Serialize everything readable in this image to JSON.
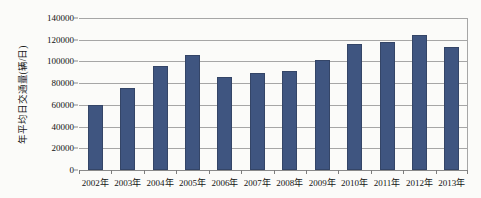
{
  "chart_data": {
    "type": "bar",
    "title": "",
    "xlabel": "",
    "ylabel": "年平均日交通量(辆/日)",
    "categories": [
      "2002年",
      "2003年",
      "2004年",
      "2005年",
      "2006年",
      "2007年",
      "2008年",
      "2009年",
      "2010年",
      "2011年",
      "2012年",
      "2013年"
    ],
    "values": [
      60000,
      76000,
      96000,
      106000,
      86000,
      89000,
      91000,
      101000,
      116000,
      118000,
      124000,
      113000
    ],
    "ylim": [
      0,
      140000
    ],
    "ytick_labels": [
      "140000",
      "120000",
      "100000",
      "80000",
      "60000",
      "40000",
      "20000",
      "0"
    ],
    "ytick_values": [
      140000,
      120000,
      100000,
      80000,
      60000,
      40000,
      20000,
      0
    ],
    "grid": true,
    "legend": "none",
    "series_color": "#3f5580",
    "gridline_color": "#a6a6a6",
    "background_color": "#fbfbf9"
  }
}
